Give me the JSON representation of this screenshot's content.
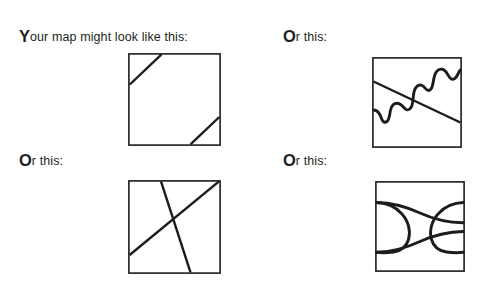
{
  "page": {
    "background_color": "#ffffff",
    "ink_color": "#1c1c1c",
    "width": 489,
    "height": 288
  },
  "panels": [
    {
      "id": "top-left",
      "caption_initial": "Y",
      "caption_rest": "our map might look like this:",
      "caption_full": "Your map might look like this:",
      "figure_name": "square-with-two-corner-diagonals",
      "figure_description": "Square outline with a short diagonal line cutting across the top-left corner and another short diagonal cutting across the bottom-right corner."
    },
    {
      "id": "top-right",
      "caption_initial": "O",
      "caption_rest": "r this:",
      "caption_full": "Or this:",
      "figure_name": "square-with-diagonal-and-wavy-curve",
      "figure_description": "Square outline containing a straight diagonal line running from the left edge down to the right edge, crossed by a thick wavy stair-step curve rising from the lower-left edge to the upper-right edge."
    },
    {
      "id": "bottom-left",
      "caption_initial": "O",
      "caption_rest": "r this:",
      "caption_full": "Or this:",
      "figure_name": "square-with-crossing-lines",
      "figure_description": "Square outline containing two straight lines that cross near the middle forming an X: one from the top-right corner down to the lower-left edge, the other from the top edge near centre down to the bottom edge right of centre."
    },
    {
      "id": "bottom-right",
      "caption_initial": "O",
      "caption_rest": "r this:",
      "caption_full": "Or this:",
      "figure_name": "square-with-crossing-curves-loop",
      "figure_description": "Square outline containing two long curves that cross twice, near the top and near the bottom, enclosing an eye-shaped loop in the centre."
    }
  ]
}
